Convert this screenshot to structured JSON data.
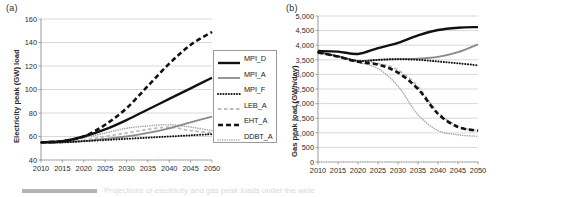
{
  "figure": {
    "caption_partial": "Projections of electricity and gas peak loads under the wide",
    "panels": [
      {
        "tag": "(a)"
      },
      {
        "tag": "(b)"
      }
    ]
  },
  "legend": {
    "position": "right-inside",
    "entries": [
      {
        "label": "MPI_D",
        "style": "solid",
        "color": "#111111",
        "width": 2.4
      },
      {
        "label": "MPI_A",
        "style": "solid",
        "color": "#8a8a8a",
        "width": 1.8
      },
      {
        "label": "MPI_F",
        "style": "dotted",
        "color": "#111111",
        "width": 2.0
      },
      {
        "label": "LEB_A",
        "style": "dashed",
        "color": "#bdbdbd",
        "width": 1.8
      },
      {
        "label": "EHT_A",
        "style": "dashed-bold",
        "color": "#111111",
        "width": 2.6
      },
      {
        "label": "DDBT_A",
        "style": "fine-dotted",
        "color": "#a8a8a8",
        "width": 1.6
      }
    ]
  },
  "chart_data": [
    {
      "type": "line",
      "panel": "(a)",
      "title": "",
      "xlabel": "",
      "ylabel": "Electricity peak (GW) load",
      "x": [
        2010,
        2015,
        2020,
        2025,
        2030,
        2035,
        2040,
        2045,
        2050
      ],
      "xlim": [
        2010,
        2050
      ],
      "ylim": [
        40,
        160
      ],
      "yticks": [
        40,
        60,
        80,
        100,
        120,
        140,
        160
      ],
      "xticks": [
        2010,
        2015,
        2020,
        2025,
        2030,
        2035,
        2040,
        2045,
        2050
      ],
      "grid": true,
      "series": [
        {
          "name": "MPI_D",
          "values": [
            55,
            56,
            60,
            66,
            74,
            83,
            92,
            101,
            110
          ]
        },
        {
          "name": "MPI_A",
          "values": [
            55,
            55,
            56,
            58,
            60,
            63,
            67,
            72,
            77
          ]
        },
        {
          "name": "MPI_F",
          "values": [
            55,
            55,
            56,
            57,
            58,
            59,
            60,
            61,
            62
          ]
        },
        {
          "name": "LEB_A",
          "values": [
            55,
            55,
            57,
            60,
            63,
            66,
            68,
            65,
            63
          ]
        },
        {
          "name": "EHT_A",
          "values": [
            55,
            56,
            60,
            70,
            84,
            103,
            122,
            138,
            149
          ]
        },
        {
          "name": "DDBT_A",
          "values": [
            55,
            56,
            59,
            63,
            67,
            69,
            70,
            68,
            65
          ]
        }
      ]
    },
    {
      "type": "line",
      "panel": "(b)",
      "title": "",
      "xlabel": "",
      "ylabel": "Gas peak load (GWh/day)",
      "x": [
        2010,
        2015,
        2020,
        2025,
        2030,
        2035,
        2040,
        2045,
        2050
      ],
      "xlim": [
        2010,
        2050
      ],
      "ylim": [
        0,
        5000
      ],
      "yticks": [
        0,
        500,
        1000,
        1500,
        2000,
        2500,
        3000,
        3500,
        4000,
        4500,
        5000
      ],
      "ytick_labels": [
        "0",
        "500",
        "1,000",
        "1,500",
        "2,000",
        "2,500",
        "3,000",
        "3,500",
        "4,000",
        "4,500",
        "5,000"
      ],
      "xticks": [
        2010,
        2015,
        2020,
        2025,
        2030,
        2035,
        2040,
        2045,
        2050
      ],
      "grid": true,
      "series": [
        {
          "name": "MPI_D",
          "values": [
            3800,
            3780,
            3700,
            3900,
            4080,
            4340,
            4520,
            4600,
            4620
          ]
        },
        {
          "name": "MPI_A",
          "values": [
            3760,
            3620,
            3460,
            3500,
            3520,
            3540,
            3600,
            3760,
            4030
          ]
        },
        {
          "name": "MPI_F",
          "values": [
            3760,
            3620,
            3460,
            3500,
            3520,
            3500,
            3440,
            3380,
            3310
          ]
        },
        {
          "name": "LEB_A",
          "values": [
            3760,
            3620,
            3450,
            3380,
            3150,
            2580,
            1700,
            1220,
            1070
          ]
        },
        {
          "name": "EHT_A",
          "values": [
            3750,
            3610,
            3430,
            3340,
            3060,
            2500,
            1650,
            1200,
            1070
          ]
        },
        {
          "name": "DDBT_A",
          "values": [
            3750,
            3600,
            3420,
            3200,
            2600,
            1620,
            1080,
            930,
            880
          ]
        }
      ]
    }
  ]
}
